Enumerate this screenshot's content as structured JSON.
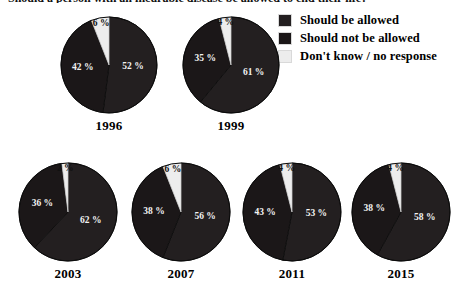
{
  "title": "Should a person with an incurable disease be allowed to end their life?",
  "legend": {
    "items": [
      {
        "label": "Should be allowed",
        "color": "#231f20",
        "key": "allowed"
      },
      {
        "label": "Should not be allowed",
        "color": "#1b1718",
        "key": "not_allowed"
      },
      {
        "label": "Don't know / no response",
        "color": "#ededed",
        "key": "dont_know"
      }
    ]
  },
  "chart_data": {
    "type": "pie",
    "title": "Should a person with an incurable disease be allowed to end their life?",
    "legend_position": "top-right",
    "unit": "%",
    "categories": [
      "Should be allowed",
      "Should not be allowed",
      "Don't know / no response"
    ],
    "colors": [
      "#231f20",
      "#1b1718",
      "#ededed"
    ],
    "charts": [
      {
        "year": "1996",
        "values": [
          52,
          42,
          6
        ],
        "labels": [
          "52 %",
          "42 %",
          "6 %"
        ]
      },
      {
        "year": "1999",
        "values": [
          61,
          35,
          4
        ],
        "labels": [
          "61 %",
          "35 %",
          "4 %"
        ]
      },
      {
        "year": "2003",
        "values": [
          62,
          36,
          2
        ],
        "labels": [
          "62 %",
          "36 %",
          "2 %"
        ]
      },
      {
        "year": "2007",
        "values": [
          56,
          38,
          6
        ],
        "labels": [
          "56 %",
          "38 %",
          "6 %"
        ]
      },
      {
        "year": "2011",
        "values": [
          53,
          43,
          4
        ],
        "labels": [
          "53 %",
          "43 %",
          "4 %"
        ]
      },
      {
        "year": "2015",
        "values": [
          58,
          38,
          4
        ],
        "labels": [
          "58 %",
          "38 %",
          "4 %"
        ]
      }
    ]
  },
  "layout": {
    "top_row": [
      {
        "index": 0,
        "left": 60,
        "top": 16,
        "size": 98
      },
      {
        "index": 1,
        "left": 182,
        "top": 16,
        "size": 98
      }
    ],
    "bottom_row": [
      {
        "index": 2,
        "left": 18,
        "top": 162,
        "size": 100
      },
      {
        "index": 3,
        "left": 131,
        "top": 162,
        "size": 100
      },
      {
        "index": 4,
        "left": 242,
        "top": 162,
        "size": 100
      },
      {
        "index": 5,
        "left": 351,
        "top": 162,
        "size": 100
      }
    ]
  }
}
